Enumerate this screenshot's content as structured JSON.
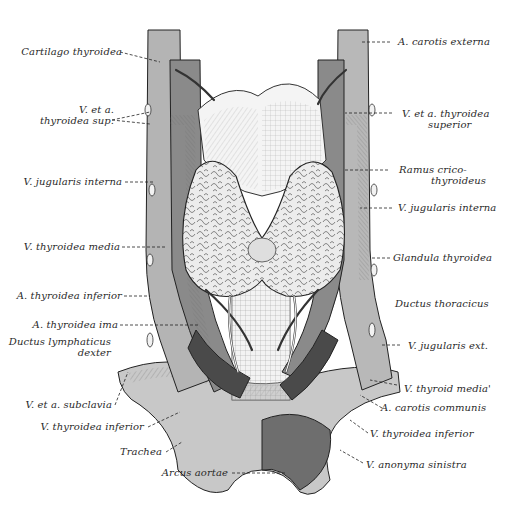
{
  "figure": {
    "colors": {
      "background": "#ffffff",
      "vessel_light": "#b8b8b8",
      "vessel_mid": "#8c8c8c",
      "vessel_dark": "#4a4a4a",
      "gland": "#e4e4e4",
      "line": "#1a1a1a"
    }
  },
  "labels_left": [
    {
      "id": "cartilago-thyroidea",
      "text": "Cartilago thyroidea"
    },
    {
      "id": "v-et-a-thyroidea-sup",
      "line1": "V. et a.",
      "line2": "thyroidea sup."
    },
    {
      "id": "v-jugularis-interna-left",
      "text": "V. jugularis interna"
    },
    {
      "id": "v-thyroidea-media-left",
      "text": "V. thyroidea media"
    },
    {
      "id": "a-thyroidea-inferior",
      "text": "A. thyroidea inferior"
    },
    {
      "id": "a-thyroidea-ima",
      "text": "A. thyroidea ima"
    },
    {
      "id": "ductus-lymphaticus-dexter",
      "line1": "Ductus lymphaticus",
      "line2": "dexter"
    },
    {
      "id": "v-et-a-subclavia",
      "text": "V. et a. subclavia"
    },
    {
      "id": "v-thyroidea-inferior-left",
      "text": "V. thyroidea inferior"
    },
    {
      "id": "trachea",
      "text": "Trachea"
    },
    {
      "id": "arcus-aortae",
      "text": "Arcus aortae"
    }
  ],
  "labels_right": [
    {
      "id": "a-carotis-externa",
      "text": "A. carotis externa"
    },
    {
      "id": "v-et-a-thyroidea-superior",
      "line1": "V. et a. thyroidea",
      "line2": "superior"
    },
    {
      "id": "ramus-cricothyroideus",
      "line1": "Ramus crico-",
      "line2": "thyroideus"
    },
    {
      "id": "v-jugularis-interna-right",
      "text": "V. jugularis interna"
    },
    {
      "id": "glandula-thyroidea",
      "text": "Glandula thyroidea"
    },
    {
      "id": "ductus-thoracicus",
      "text": "Ductus thoracicus"
    },
    {
      "id": "v-jugularis-ext",
      "text": "V. jugularis ext."
    },
    {
      "id": "v-thyroid-media",
      "text": "V. thyroid media'"
    },
    {
      "id": "a-carotis-communis",
      "text": "A. carotis communis"
    },
    {
      "id": "v-thyroidea-inferior-right",
      "text": "V. thyroidea inferior"
    },
    {
      "id": "v-anonyma-sinistra",
      "text": "V. anonyma sinistra"
    }
  ]
}
